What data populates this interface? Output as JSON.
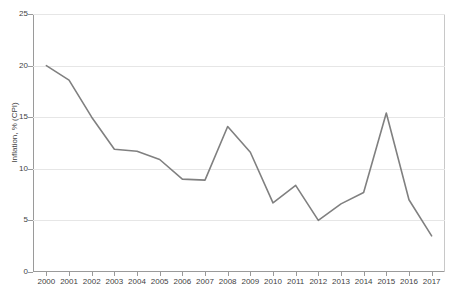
{
  "chart_data": {
    "type": "line",
    "title": "",
    "xlabel": "",
    "ylabel": "Inflation, % (CPI)",
    "xlim": [
      2000,
      2017
    ],
    "ylim": [
      0,
      25
    ],
    "ytick_labels": [
      "0",
      "5",
      "10",
      "15",
      "20",
      "25"
    ],
    "ytick_values": [
      0,
      5,
      10,
      15,
      20,
      25
    ],
    "grid": true,
    "legend": "none",
    "line_color": "#808080",
    "categories": [
      "2000",
      "2001",
      "2002",
      "2003",
      "2004",
      "2005",
      "2006",
      "2007",
      "2008",
      "2009",
      "2010",
      "2011",
      "2012",
      "2013",
      "2014",
      "2015",
      "2016",
      "2017"
    ],
    "x": [
      2000,
      2001,
      2002,
      2003,
      2004,
      2005,
      2006,
      2007,
      2008,
      2009,
      2010,
      2011,
      2012,
      2013,
      2014,
      2015,
      2016,
      2017
    ],
    "values": [
      20.0,
      18.6,
      15.0,
      11.9,
      11.7,
      10.9,
      9.0,
      8.9,
      14.1,
      11.6,
      6.7,
      8.4,
      5.0,
      6.6,
      7.7,
      15.4,
      7.0,
      3.5
    ],
    "series": [
      {
        "name": "Inflation, % (CPI)",
        "values": [
          20.0,
          18.6,
          15.0,
          11.9,
          11.7,
          10.9,
          9.0,
          8.9,
          14.1,
          11.6,
          6.7,
          8.4,
          5.0,
          6.6,
          7.7,
          15.4,
          7.0,
          3.5
        ]
      }
    ]
  }
}
